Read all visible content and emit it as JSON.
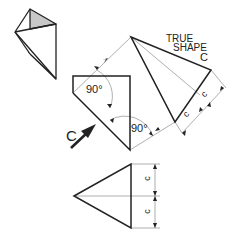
{
  "figure": {
    "title_label": {
      "line1": "TRUE",
      "line2": "SHAPE",
      "line3": "C"
    },
    "angle_labels": [
      "90°",
      "90°"
    ],
    "view_direction_label": "C",
    "dimension_labels": {
      "true_shape_upper": "c",
      "true_shape_lower": "c",
      "elevation_upper": "c",
      "elevation_lower": "c"
    },
    "colors": {
      "line": "#222222",
      "construction_line": "#9a9a9a",
      "shaded_face": "#c8c8c8",
      "background": "#ffffff"
    }
  }
}
